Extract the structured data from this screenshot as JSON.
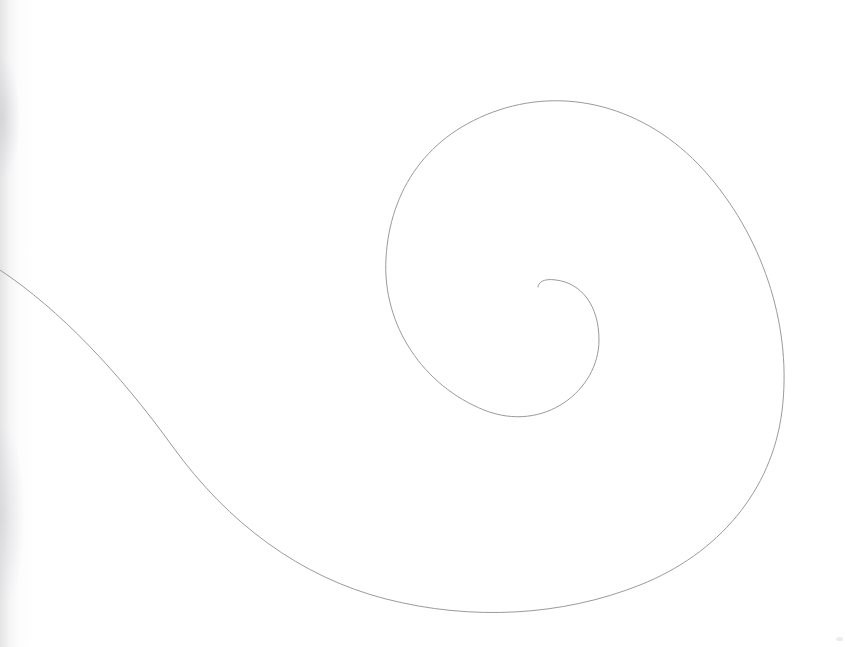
{
  "page": {
    "medium": "scanned pencil line drawing on white paper",
    "background_color": "#ffffff",
    "width": 845,
    "height": 647
  },
  "artwork": {
    "name": "spiral",
    "subject": "single continuous inward-winding spiral curve",
    "stroke_color": "#9a9a9c",
    "stroke_width": 1,
    "turns": "approximately 1.6",
    "winding_direction": "clockwise inward",
    "center_point": {
      "x": 540,
      "y": 287
    },
    "entry_edge": "left",
    "entry_point": {
      "x": 0,
      "y": 270
    },
    "extents": {
      "outer_top": {
        "x": 585,
        "y": 110
      },
      "outer_right": {
        "x": 783,
        "y": 330
      },
      "outer_bottom": {
        "x": 510,
        "y": 608
      },
      "inner_left": {
        "x": 385,
        "y": 270
      },
      "inner_bottom": {
        "x": 500,
        "y": 415
      },
      "inner_right": {
        "x": 600,
        "y": 320
      }
    },
    "path": "M 0,270 C 60,310 118,371 173,447 C 228,523 300,577 386,599 C 472,621 562,616 640,585 C 718,554 772,491 782,411 C 792,331 766,243 709,176 C 652,109 571,86 499,110 C 427,134 390,190 386,258 C 382,326 424,386 484,410 C 544,434 599,390 599,340 C 599,305 581,283 556,280 C 543,278 538,283 538,287"
  },
  "artifacts": {
    "left_edge_smudge": "faint vertical gray scanner shadow along the left paper edge",
    "corner_speck": "small gray speck near the bottom-right corner"
  }
}
